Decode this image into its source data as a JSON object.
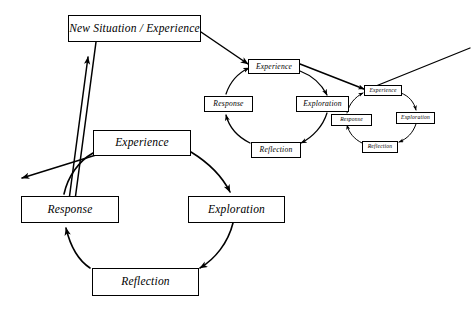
{
  "diagram": {
    "title_node": {
      "label": "New Situation / Experience",
      "x": 68,
      "y": 15,
      "w": 133,
      "h": 27
    },
    "cycles": [
      {
        "name": "large-cycle",
        "size": "large",
        "nodes": [
          {
            "key": "experience",
            "label": "Experience",
            "x": 93,
            "y": 130,
            "w": 98,
            "h": 26
          },
          {
            "key": "exploration",
            "label": "Exploration",
            "x": 188,
            "y": 196,
            "w": 97,
            "h": 27
          },
          {
            "key": "reflection",
            "label": "Reflection",
            "x": 92,
            "y": 268,
            "w": 107,
            "h": 28
          },
          {
            "key": "response",
            "label": "Response",
            "x": 21,
            "y": 196,
            "w": 98,
            "h": 27
          }
        ]
      },
      {
        "name": "medium-cycle",
        "size": "medium",
        "nodes": [
          {
            "key": "experience",
            "label": "Experience",
            "x": 248,
            "y": 59,
            "w": 52,
            "h": 15
          },
          {
            "key": "exploration",
            "label": "Exploration",
            "x": 296,
            "y": 96,
            "w": 53,
            "h": 16
          },
          {
            "key": "reflection",
            "label": "Reflection",
            "x": 251,
            "y": 142,
            "w": 50,
            "h": 16
          },
          {
            "key": "response",
            "label": "Response",
            "x": 204,
            "y": 96,
            "w": 49,
            "h": 16
          }
        ]
      },
      {
        "name": "small-cycle",
        "size": "small",
        "nodes": [
          {
            "key": "experience",
            "label": "Experience",
            "x": 364,
            "y": 85,
            "w": 38,
            "h": 11
          },
          {
            "key": "exploration",
            "label": "Exploration",
            "x": 396,
            "y": 112,
            "w": 39,
            "h": 12
          },
          {
            "key": "reflection",
            "label": "Reflection",
            "x": 362,
            "y": 141,
            "w": 36,
            "h": 12
          },
          {
            "key": "response",
            "label": "Response",
            "x": 331,
            "y": 114,
            "w": 41,
            "h": 12
          }
        ]
      }
    ],
    "colors": {
      "background": "#ffffff",
      "stroke": "#000000",
      "text": "#000000"
    },
    "connectors": [
      {
        "name": "title-to-medium-experience",
        "kind": "arrow"
      },
      {
        "name": "medium-experience-to-small-experience",
        "kind": "arrow"
      },
      {
        "name": "incoming-from-right",
        "kind": "line"
      },
      {
        "name": "outgoing-to-left",
        "kind": "arrow"
      },
      {
        "name": "response-to-title",
        "kind": "arrow"
      }
    ]
  }
}
